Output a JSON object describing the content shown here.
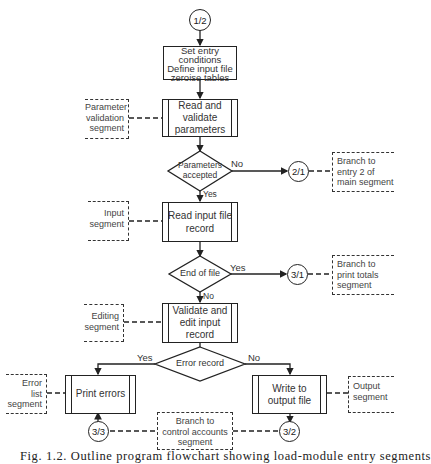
{
  "figure": {
    "type": "flowchart",
    "caption": "Fig. 1.2. Outline program flowchart showing load-module entry segments",
    "entry_connector": "1/2",
    "nodes": {
      "init": "Set entry conditions Define input file zeroise tables",
      "init_lines": [
        "Set entry",
        "conditions",
        "Define input file",
        "zeroise tables"
      ],
      "read_params": [
        "Read and",
        "validate",
        "parameters"
      ],
      "params_decision": [
        "Parameters",
        "accepted"
      ],
      "read_input": [
        "Read input file",
        "record"
      ],
      "eof_decision": "End of file",
      "validate_edit": [
        "Validate and",
        "edit input",
        "record"
      ],
      "error_decision": "Error record",
      "print_errors": "Print errors",
      "write_output": [
        "Write to",
        "output file"
      ]
    },
    "connectors": {
      "params_no": "2/1",
      "eof_yes": "3/1",
      "errors_exit": "3/3",
      "output_exit": "3/2"
    },
    "flow_labels": {
      "params_no": "No",
      "params_yes": "Yes",
      "eof_yes": "Yes",
      "eof_no": "No",
      "error_yes": "Yes",
      "error_no": "No"
    },
    "annotations": {
      "param_validation": [
        "Parameter",
        "validation",
        "segment"
      ],
      "input_segment": [
        "Input",
        "segment"
      ],
      "editing_segment": [
        "Editing",
        "segment"
      ],
      "error_list_segment": [
        "Error",
        "list",
        "segment"
      ],
      "output_segment": [
        "Output",
        "segment"
      ],
      "branch_entry2": [
        "Branch to",
        "entry 2 of",
        "main segment"
      ],
      "branch_totals": [
        "Branch to",
        "print totals",
        "segment"
      ],
      "branch_control": [
        "Branch to",
        "control accounts",
        "segment"
      ]
    },
    "colors": {
      "line": "#222222",
      "text": "#333333",
      "background": "#ffffff"
    }
  }
}
